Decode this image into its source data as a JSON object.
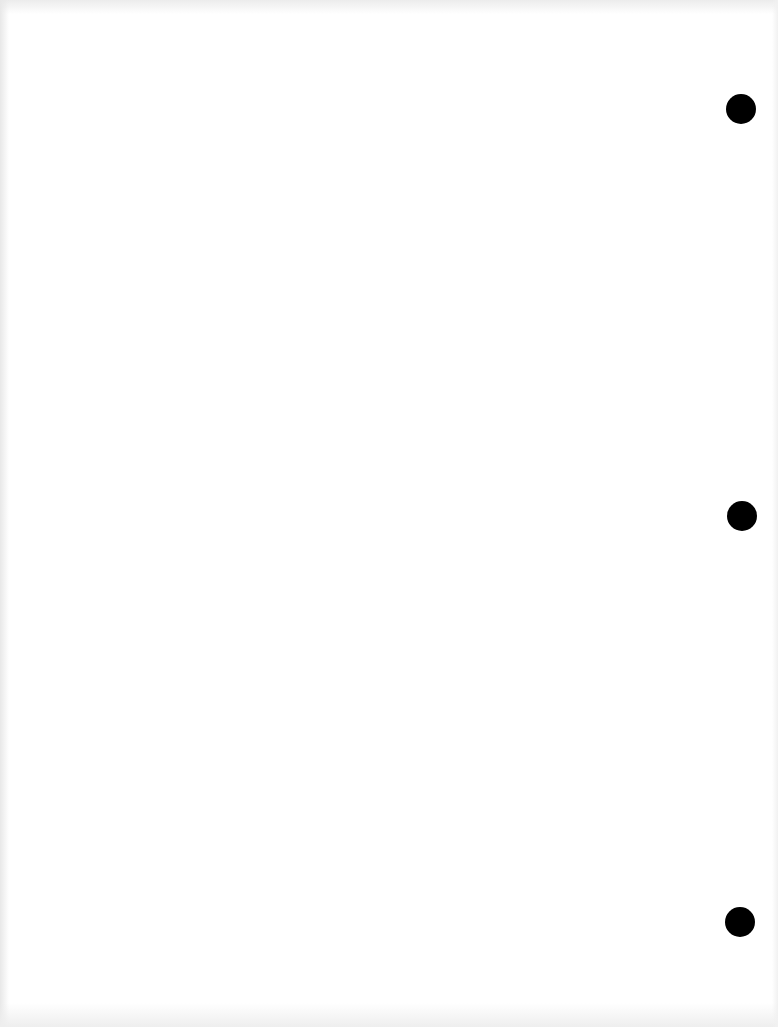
{
  "document": {
    "type": "blank-scanned-page",
    "text": "",
    "background_color": "#ffffff",
    "punch_holes": {
      "count": 3,
      "color": "#000000",
      "side": "right"
    }
  }
}
